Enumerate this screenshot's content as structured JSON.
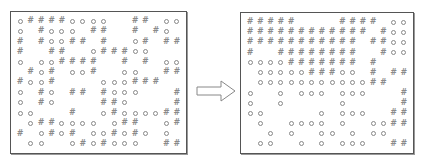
{
  "diagram": {
    "symbols": {
      "O": "circle",
      "#": "hash",
      "": "empty"
    },
    "colors": {
      "border": "#555555",
      "symbol": "#888888",
      "arrow": "#888888",
      "background": "#ffffff"
    },
    "arrow": {
      "direction": "right",
      "icon": "hollow-right-arrow"
    },
    "left_panel": {
      "label": "before",
      "rows": [
        [
          "O",
          "#",
          "#",
          "#",
          "#",
          "O",
          "O",
          "O",
          "O",
          "",
          "",
          "#",
          "#",
          "",
          "O",
          "O"
        ],
        [
          "O",
          "",
          "#",
          "O",
          "O",
          "O",
          "",
          "#",
          "#",
          "",
          "",
          "#",
          "",
          "#",
          "O",
          ""
        ],
        [
          "#",
          "",
          "#",
          "O",
          "O",
          "#",
          "#",
          "",
          "#",
          "",
          "",
          "O",
          "#",
          "",
          "#",
          "#"
        ],
        [
          "#",
          "",
          "",
          "#",
          "#",
          "",
          "",
          "O",
          "#",
          "#",
          "#",
          "O",
          "O",
          "",
          "",
          ""
        ],
        [
          "O",
          "",
          "O",
          "O",
          "#",
          "#",
          "#",
          "#",
          "",
          "",
          "#",
          "",
          "#",
          "",
          "O",
          "O"
        ],
        [
          "",
          "#",
          "O",
          "#",
          "",
          "O",
          "O",
          "#",
          "",
          "",
          "O",
          "O",
          "",
          "",
          "#",
          "#"
        ],
        [
          "#",
          "O",
          "O",
          "#",
          "",
          "",
          "",
          "",
          "O",
          "O",
          "O",
          "#",
          "#",
          "#",
          "",
          ""
        ],
        [
          "O",
          "",
          "#",
          "O",
          "",
          "#",
          "#",
          "",
          "#",
          "O",
          "O",
          "O",
          "",
          "",
          "",
          "#"
        ],
        [
          "O",
          "",
          "#",
          "O",
          "",
          "",
          "",
          "",
          "#",
          "#",
          "O",
          "",
          "",
          "",
          "",
          "#"
        ],
        [
          "O",
          "O",
          "",
          "",
          "",
          "#",
          "",
          "",
          "O",
          "#",
          "O",
          "O",
          "O",
          "O",
          "#",
          "#"
        ],
        [
          "",
          "O",
          "#",
          "#",
          "O",
          "O",
          "O",
          "O",
          "",
          "O",
          "#",
          "#",
          "",
          "",
          "O",
          "#"
        ],
        [
          "#",
          "",
          "O",
          "#",
          "O",
          "#",
          "",
          "O",
          "O",
          "#",
          "O",
          "#",
          "O",
          "",
          "O",
          ""
        ],
        [
          "",
          "O",
          "O",
          "",
          "",
          "O",
          "#",
          "O",
          "#",
          "O",
          "O",
          "O",
          "",
          "",
          "#",
          "#"
        ]
      ]
    },
    "right_panel": {
      "label": "after",
      "rows": [
        [
          "#",
          "#",
          "#",
          "#",
          "#",
          "",
          "",
          "",
          "",
          "#",
          "#",
          "#",
          "#",
          "",
          "O",
          "O"
        ],
        [
          "#",
          "#",
          "#",
          "#",
          "#",
          "#",
          "#",
          "#",
          "#",
          "#",
          "#",
          "#",
          "",
          "#",
          "O",
          "O"
        ],
        [
          "#",
          "#",
          "#",
          "#",
          "#",
          "#",
          "#",
          "#",
          "#",
          "#",
          "#",
          "",
          "#",
          "#",
          "O",
          "O"
        ],
        [
          "#",
          "",
          "",
          "#",
          "#",
          "#",
          "#",
          "#",
          "#",
          "#",
          "#",
          "",
          "",
          "#",
          "O",
          "O"
        ],
        [
          "O",
          "O",
          "O",
          "O",
          "#",
          "#",
          "#",
          "#",
          "#",
          "#",
          "#",
          "",
          "#",
          "",
          "",
          ""
        ],
        [
          "",
          "O",
          "O",
          "O",
          "O",
          "O",
          "#",
          "#",
          "#",
          "O",
          "O",
          "",
          "#",
          "",
          "#",
          "#"
        ],
        [
          "",
          "O",
          "O",
          "O",
          "O",
          "O",
          "O",
          "O",
          "O",
          "O",
          "O",
          "O",
          "#",
          "#",
          "",
          ""
        ],
        [
          "O",
          "",
          "",
          "O",
          "",
          "O",
          "O",
          "O",
          "",
          "O",
          "O",
          "O",
          "",
          "",
          "",
          "#"
        ],
        [
          "O",
          "",
          "",
          "O",
          "",
          "",
          "",
          "",
          "",
          "O",
          "",
          "",
          "",
          "",
          "",
          "#"
        ],
        [
          "O",
          "O",
          "",
          "",
          "",
          "",
          "",
          "O",
          "",
          "O",
          "O",
          "O",
          "",
          "",
          "#",
          "#"
        ],
        [
          "",
          "O",
          "",
          "",
          "O",
          "O",
          "O",
          "O",
          "",
          "O",
          "",
          "",
          "O",
          "O",
          "#",
          "#"
        ],
        [
          "",
          "",
          "O",
          "",
          "O",
          "",
          "",
          "O",
          "O",
          "",
          "O",
          "",
          "O",
          "O",
          "",
          ""
        ],
        [
          "",
          "O",
          "O",
          "",
          "",
          "O",
          "",
          "O",
          "",
          "O",
          "O",
          "O",
          "",
          "",
          "#",
          "#"
        ]
      ]
    }
  }
}
